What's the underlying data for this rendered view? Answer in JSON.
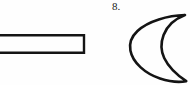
{
  "page": {
    "width": 190,
    "height": 85,
    "background_color": "#fefefe",
    "ink_color": "#141414"
  },
  "figures": {
    "rectangle": {
      "name": "long-thin-rectangle",
      "description": "Outlined elongated horizontal rectangle, left end cropped by page edge",
      "stroke_color": "#141414",
      "fill_color": "none",
      "stroke_width": 2.4,
      "bounds": {
        "x": -6,
        "y": 34,
        "width": 90,
        "height": 20
      }
    },
    "crescent": {
      "name": "crescent-lune",
      "description": "Crescent (lune) outline with pointed tips at upper-right and lower-right",
      "stroke_color": "#141414",
      "fill_color": "none",
      "stroke_width": 2.6,
      "bounds": {
        "x": 130,
        "y": 14,
        "width": 56,
        "height": 68
      },
      "tip_top": {
        "x": 185,
        "y": 15
      },
      "tip_bottom": {
        "x": 186,
        "y": 81
      },
      "outer_extreme_left": {
        "x": 130,
        "y": 48
      },
      "inner_extreme_left": {
        "x": 162,
        "y": 48
      }
    }
  },
  "labels": {
    "figure_number": "8."
  }
}
